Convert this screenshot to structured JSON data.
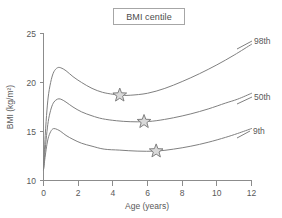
{
  "chart_data": {
    "type": "line",
    "title": "BMI centile",
    "xlabel": "Age (years)",
    "ylabel": "BMI (kg/m²)",
    "xlim": [
      0,
      12
    ],
    "ylim": [
      10,
      25
    ],
    "xticks": [
      0,
      2,
      4,
      6,
      8,
      10,
      12
    ],
    "yticks": [
      10,
      15,
      20,
      25
    ],
    "xtick_labels": [
      "0",
      "2",
      "4",
      "6",
      "8",
      "10",
      "12"
    ],
    "ytick_labels": [
      "10",
      "15",
      "20",
      "25"
    ],
    "grid": false,
    "legend_position": "right-inline-labels",
    "series": [
      {
        "name": "98th",
        "label": "98th",
        "color": "#808080",
        "points": [
          [
            0.0,
            11.1
          ],
          [
            0.1,
            14.6
          ],
          [
            0.2,
            17.2
          ],
          [
            0.3,
            18.9
          ],
          [
            0.45,
            20.3
          ],
          [
            0.6,
            21.1
          ],
          [
            0.8,
            21.5
          ],
          [
            1.0,
            21.5
          ],
          [
            1.3,
            21.2
          ],
          [
            1.7,
            20.6
          ],
          [
            2.2,
            20.0
          ],
          [
            2.8,
            19.4
          ],
          [
            3.4,
            19.0
          ],
          [
            4.0,
            18.8
          ],
          [
            4.4,
            18.7
          ],
          [
            5.0,
            18.7
          ],
          [
            6.0,
            18.9
          ],
          [
            7.0,
            19.4
          ],
          [
            8.0,
            20.1
          ],
          [
            9.0,
            20.9
          ],
          [
            10.0,
            21.8
          ],
          [
            11.0,
            22.8
          ],
          [
            12.0,
            23.9
          ]
        ],
        "marker": {
          "at": [
            4.4,
            18.7
          ],
          "shape": "star"
        }
      },
      {
        "name": "50th",
        "label": "50th",
        "color": "#808080",
        "points": [
          [
            0.0,
            11.1
          ],
          [
            0.1,
            13.2
          ],
          [
            0.2,
            15.0
          ],
          [
            0.3,
            16.3
          ],
          [
            0.45,
            17.4
          ],
          [
            0.6,
            18.0
          ],
          [
            0.8,
            18.3
          ],
          [
            1.0,
            18.3
          ],
          [
            1.3,
            18.0
          ],
          [
            1.7,
            17.5
          ],
          [
            2.2,
            17.0
          ],
          [
            2.8,
            16.6
          ],
          [
            3.4,
            16.3
          ],
          [
            4.2,
            16.1
          ],
          [
            5.0,
            16.0
          ],
          [
            5.8,
            16.0
          ],
          [
            6.5,
            16.1
          ],
          [
            7.5,
            16.4
          ],
          [
            8.5,
            16.8
          ],
          [
            9.5,
            17.3
          ],
          [
            10.5,
            17.9
          ],
          [
            11.2,
            18.3
          ],
          [
            12.0,
            18.9
          ]
        ],
        "marker": {
          "at": [
            5.8,
            16.0
          ],
          "shape": "star"
        }
      },
      {
        "name": "9th",
        "label": "9th",
        "color": "#808080",
        "points": [
          [
            0.0,
            11.1
          ],
          [
            0.1,
            12.5
          ],
          [
            0.2,
            13.7
          ],
          [
            0.3,
            14.5
          ],
          [
            0.45,
            15.1
          ],
          [
            0.6,
            15.3
          ],
          [
            0.8,
            15.2
          ],
          [
            1.0,
            15.0
          ],
          [
            1.3,
            14.6
          ],
          [
            1.7,
            14.2
          ],
          [
            2.2,
            13.8
          ],
          [
            2.8,
            13.5
          ],
          [
            3.5,
            13.2
          ],
          [
            4.4,
            13.1
          ],
          [
            5.4,
            13.0
          ],
          [
            6.5,
            13.0
          ],
          [
            7.5,
            13.2
          ],
          [
            8.5,
            13.5
          ],
          [
            9.5,
            13.9
          ],
          [
            10.5,
            14.4
          ],
          [
            11.2,
            14.8
          ],
          [
            12.0,
            15.3
          ]
        ],
        "marker": {
          "at": [
            6.5,
            13.0
          ],
          "shape": "star"
        }
      }
    ],
    "annotations": [
      {
        "name": "marker-98th",
        "series": "98th",
        "x": 4.4,
        "y": 18.7,
        "shape": "star"
      },
      {
        "name": "marker-50th",
        "series": "50th",
        "x": 5.8,
        "y": 16.0,
        "shape": "star"
      },
      {
        "name": "marker-9th",
        "series": "9th",
        "x": 6.5,
        "y": 13.0,
        "shape": "star"
      }
    ],
    "colors": {
      "curve": "#808080",
      "axis": "#8c8c8c",
      "text": "#595959",
      "marker_fill": "#d9d9d9",
      "background": "#ffffff"
    }
  }
}
